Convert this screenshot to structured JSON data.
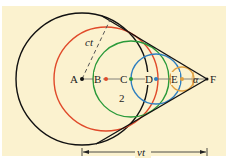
{
  "figure": {
    "background": "#fbf2cf",
    "frame": {
      "x": 2,
      "y": 6,
      "w": 224,
      "h": 150
    }
  },
  "points": [
    {
      "label": "A",
      "x": 82,
      "y": 79,
      "color": "#111111"
    },
    {
      "label": "B",
      "x": 106,
      "y": 79,
      "color": "#e04a2a"
    },
    {
      "label": "C",
      "x": 131,
      "y": 79,
      "color": "#2a9a3a"
    },
    {
      "label": "D",
      "x": 156,
      "y": 79,
      "color": "#2f7fc0"
    },
    {
      "label": "E",
      "x": 182,
      "y": 79,
      "color": "#e0a040"
    },
    {
      "label": "F",
      "x": 207,
      "y": 79,
      "color": "#111111"
    }
  ],
  "circles": [
    {
      "center": "A",
      "cx": 82,
      "cy": 79,
      "r": 66,
      "color": "#111111"
    },
    {
      "center": "B",
      "cx": 106,
      "cy": 79,
      "r": 52,
      "color": "#e04a2a"
    },
    {
      "center": "C",
      "cx": 131,
      "cy": 79,
      "r": 38,
      "color": "#2a9a3a"
    },
    {
      "center": "D",
      "cx": 156,
      "cy": 79,
      "r": 25,
      "color": "#2f7fc0"
    },
    {
      "center": "E",
      "cx": 182,
      "cy": 79,
      "r": 12,
      "color": "#e0a040"
    }
  ],
  "labels": {
    "ct": "ct",
    "region_number": "2",
    "angle": "α",
    "vt": "vt"
  },
  "colors": {
    "line": "#111111",
    "ct_dash": "#555555",
    "arrow": "#222222"
  }
}
